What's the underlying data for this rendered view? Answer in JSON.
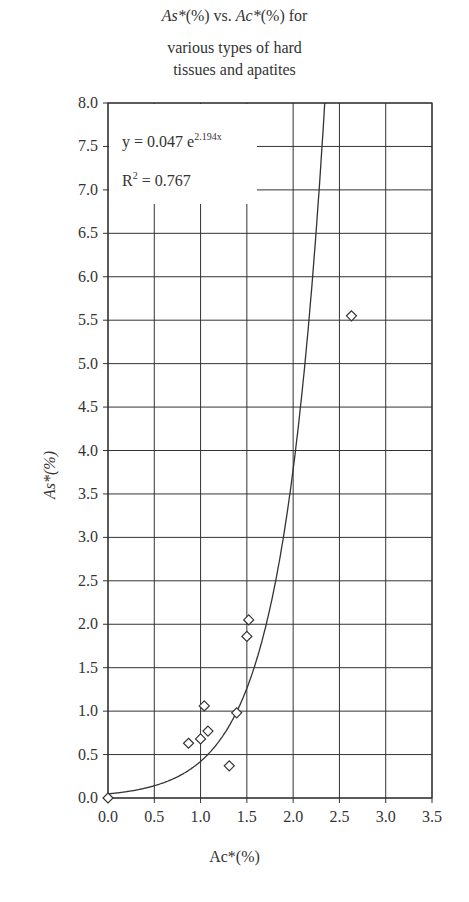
{
  "title": {
    "line1_a": "As*",
    "line1_b": "(%) vs. ",
    "line1_c": "Ac*",
    "line1_d": "(%) for",
    "line2": "various types of hard",
    "line3": "tissues and apatites"
  },
  "equation": "y = 0.047 e",
  "equation_exp": "2.194x",
  "r2_label": "R",
  "r2_value": " = 0.767",
  "chart_data": {
    "type": "scatter",
    "xlabel": "Ac*(%)",
    "ylabel": "As*(%)",
    "xlim": [
      0,
      3.5
    ],
    "ylim": [
      0,
      8.0
    ],
    "xticks": [
      "0.0",
      "0.5",
      "1.0",
      "1.5",
      "2.0",
      "2.5",
      "3.0",
      "3.5"
    ],
    "yticks": [
      "0.0",
      "0.5",
      "1.0",
      "1.5",
      "2.0",
      "2.5",
      "3.0",
      "3.5",
      "4.0",
      "4.5",
      "5.0",
      "5.5",
      "6.0",
      "6.5",
      "7.0",
      "7.5",
      "8.0"
    ],
    "grid": true,
    "series": [
      {
        "name": "Hard tissues and apatites",
        "marker": "diamond-open",
        "points": [
          {
            "x": 0.0,
            "y": 0.0
          },
          {
            "x": 0.87,
            "y": 0.63
          },
          {
            "x": 1.0,
            "y": 0.68
          },
          {
            "x": 1.08,
            "y": 0.77
          },
          {
            "x": 1.04,
            "y": 1.06
          },
          {
            "x": 1.31,
            "y": 0.37
          },
          {
            "x": 1.39,
            "y": 0.98
          },
          {
            "x": 1.5,
            "y": 1.86
          },
          {
            "x": 1.52,
            "y": 2.05
          },
          {
            "x": 2.63,
            "y": 5.55
          }
        ]
      }
    ],
    "trendline": {
      "type": "exponential",
      "a": 0.047,
      "b": 2.194,
      "r2": 0.767,
      "equation": "y = 0.047 e^(2.194x)"
    }
  }
}
